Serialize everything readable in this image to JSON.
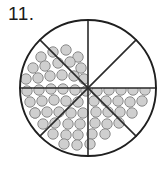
{
  "problem": {
    "number_label": "11.",
    "type": "fraction-circle-diagram"
  },
  "figure": {
    "shape": "circle",
    "total_sectors": 8,
    "shaded_sectors": 6,
    "unshaded_sectors": 2,
    "fraction_shaded": "6/8",
    "sector_angle_degrees": 45,
    "center_x": 88,
    "center_y": 88,
    "radius": 68,
    "fill_style": "gray-dots",
    "unshaded_sector_indices": [
      0,
      1
    ],
    "shaded_sector_indices": [
      2,
      3,
      4,
      5,
      6,
      7
    ],
    "caption": ""
  },
  "colors": {
    "outline": "#1f1f1f",
    "divider": "#2a2a2a",
    "dot_fill": "#cfcfcf",
    "dot_stroke": "#8a8a8a",
    "background": "#ffffff",
    "text": "#1a1a1a"
  },
  "dots": {
    "radius": 5.2,
    "count": 64,
    "points": [
      [
        41,
        57
      ],
      [
        53,
        52
      ],
      [
        66,
        50
      ],
      [
        78,
        57
      ],
      [
        33,
        68
      ],
      [
        45,
        66
      ],
      [
        58,
        63
      ],
      [
        70,
        62
      ],
      [
        81,
        68
      ],
      [
        26,
        79
      ],
      [
        38,
        78
      ],
      [
        50,
        76
      ],
      [
        62,
        75
      ],
      [
        74,
        76
      ],
      [
        84,
        79
      ],
      [
        108,
        56
      ],
      [
        120,
        53
      ],
      [
        132,
        58
      ],
      [
        96,
        65
      ],
      [
        108,
        65
      ],
      [
        120,
        64
      ],
      [
        131,
        69
      ],
      [
        143,
        66
      ],
      [
        94,
        78
      ],
      [
        105,
        77
      ],
      [
        117,
        77
      ],
      [
        129,
        78
      ],
      [
        141,
        79
      ],
      [
        152,
        78
      ],
      [
        27,
        91
      ],
      [
        39,
        90
      ],
      [
        51,
        89
      ],
      [
        63,
        89
      ],
      [
        75,
        90
      ],
      [
        86,
        91
      ],
      [
        97,
        91
      ],
      [
        109,
        90
      ],
      [
        121,
        90
      ],
      [
        133,
        90
      ],
      [
        145,
        90
      ],
      [
        30,
        102
      ],
      [
        42,
        101
      ],
      [
        54,
        100
      ],
      [
        66,
        101
      ],
      [
        78,
        102
      ],
      [
        94,
        101
      ],
      [
        106,
        101
      ],
      [
        118,
        101
      ],
      [
        130,
        102
      ],
      [
        142,
        101
      ],
      [
        35,
        113
      ],
      [
        47,
        112
      ],
      [
        59,
        112
      ],
      [
        71,
        113
      ],
      [
        83,
        113
      ],
      [
        96,
        112
      ],
      [
        108,
        112
      ],
      [
        120,
        112
      ],
      [
        132,
        113
      ],
      [
        43,
        124
      ],
      [
        55,
        123
      ],
      [
        68,
        124
      ],
      [
        80,
        124
      ],
      [
        95,
        123
      ],
      [
        107,
        124
      ],
      [
        119,
        123
      ],
      [
        53,
        134
      ],
      [
        66,
        135
      ],
      [
        78,
        135
      ],
      [
        92,
        134
      ],
      [
        105,
        134
      ],
      [
        64,
        144
      ],
      [
        77,
        145
      ],
      [
        90,
        144
      ],
      [
        35,
        113
      ]
    ]
  }
}
